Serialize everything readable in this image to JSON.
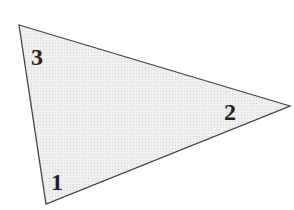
{
  "diagram": {
    "shape": "triangle",
    "fill": "#e8e8e8",
    "stroke": "#444444",
    "vertices": [
      {
        "id": "top-left",
        "x": 19,
        "y": 25
      },
      {
        "id": "right",
        "x": 290,
        "y": 106
      },
      {
        "id": "bottom",
        "x": 46,
        "y": 204
      }
    ],
    "labels": [
      {
        "text": "3",
        "x": 38,
        "y": 65
      },
      {
        "text": "2",
        "x": 224,
        "y": 120
      },
      {
        "text": "1",
        "x": 51,
        "y": 190
      }
    ]
  }
}
